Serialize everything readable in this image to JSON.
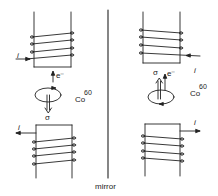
{
  "diagram": {
    "title": "",
    "mirror_label": "mirror",
    "colors": {
      "ink": "#222222",
      "background": "#ffffff"
    },
    "left_side": {
      "top_coil": {
        "current_label": "i",
        "current_direction": "into-coil"
      },
      "nucleus": {
        "label": "Co",
        "superscript": "60",
        "rotation": "counterclockwise-viewed"
      },
      "electron": {
        "label": "e⁻",
        "direction": "up"
      },
      "spin": {
        "label": "σ",
        "direction": "down"
      },
      "bottom_coil": {
        "current_label": "i",
        "current_direction": "out-of-coil"
      }
    },
    "right_side": {
      "top_coil": {
        "current_label": "i",
        "current_direction": "into-coil"
      },
      "nucleus": {
        "label": "Co",
        "superscript": "60",
        "rotation": "clockwise-viewed"
      },
      "electron": {
        "label": "e⁻",
        "direction": "up"
      },
      "spin": {
        "label": "σ",
        "direction": "up"
      },
      "bottom_coil": {
        "current_label": "i",
        "current_direction": "out-of-coil"
      }
    }
  }
}
